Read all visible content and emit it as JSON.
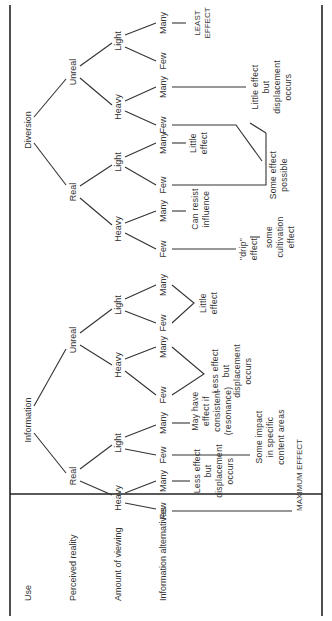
{
  "row_labels": {
    "use": "Use",
    "perceived_reality": "Perceived reality",
    "amount_of_viewing": "Amount of viewing",
    "information_alternatives": "Information alternatives"
  },
  "tree": {
    "information": {
      "label": "Information",
      "real": {
        "label": "Real",
        "heavy": {
          "label": "Heavy",
          "few": "Few",
          "many": "Many"
        },
        "light": {
          "label": "Light",
          "few": "Few",
          "many": "Many"
        }
      },
      "unreal": {
        "label": "Unreal",
        "heavy": {
          "label": "Heavy",
          "few": "Few",
          "many": "Many"
        },
        "light": {
          "label": "Light",
          "few": "Few",
          "many": "Many"
        }
      }
    },
    "diversion": {
      "label": "Diversion",
      "real": {
        "label": "Real",
        "heavy": {
          "label": "Heavy",
          "few": "Few",
          "many": "Many"
        },
        "light": {
          "label": "Light",
          "few": "Few",
          "many": "Many"
        }
      },
      "unreal": {
        "label": "Unreal",
        "heavy": {
          "label": "Heavy",
          "few": "Few",
          "many": "Many"
        },
        "light": {
          "label": "Light",
          "few": "Few",
          "many": "Many"
        }
      }
    }
  },
  "effects": {
    "info_real_heavy_many": [
      "Less effect",
      "but",
      "displacement",
      "occurs"
    ],
    "info_real_light_many": [
      "May have",
      "effect if",
      "consistent",
      "(resonance)"
    ],
    "info_real_light_few": [
      "Some impact",
      "in specific",
      "content areas"
    ],
    "info_unreal_heavy": [
      "Less effect",
      "but",
      "displacement",
      "occurs"
    ],
    "info_unreal_light": [
      "Little",
      "effect"
    ],
    "maximum_effect": "MAXIMUM EFFECT",
    "div_real_heavy_many": [
      "Can resist",
      "influence"
    ],
    "div_real_heavy_few": [
      "\"drip\"",
      "effect"
    ],
    "some_cultivation": [
      "some",
      "cultivation",
      "effect"
    ],
    "div_real_light_many": [
      "Little",
      "effect"
    ],
    "some_effect_possible": [
      "Some effect",
      "possible"
    ],
    "div_unreal_heavy_many": [
      "Little effect",
      "but",
      "displacement",
      "occurs"
    ],
    "least_effect": [
      "LEAST",
      "EFFECT"
    ]
  }
}
